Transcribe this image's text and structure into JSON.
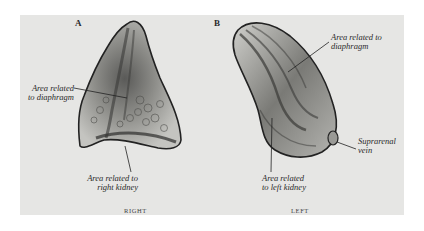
{
  "figure": {
    "panels": [
      {
        "letter": "A",
        "side_label": "RIGHT",
        "labels": [
          {
            "line1": "Area related",
            "line2": "to diaphragm"
          },
          {
            "line1": "Area related to",
            "line2": "right kidney"
          }
        ]
      },
      {
        "letter": "B",
        "side_label": "LEFT",
        "labels": [
          {
            "line1": "Area related to",
            "line2": "diaphragm"
          },
          {
            "line1": "Suprarenal",
            "line2": "vein"
          },
          {
            "line1": "Area related",
            "line2": "to left kidney"
          }
        ]
      }
    ],
    "colors": {
      "background": "#e6e6e4",
      "organ_fill": "#b8b8b4",
      "organ_dark": "#4a4a48",
      "outline": "#222222"
    }
  }
}
